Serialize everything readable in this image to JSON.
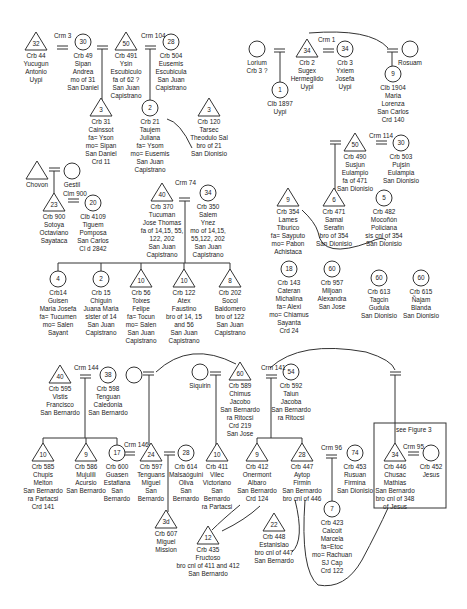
{
  "legend": {
    "see_figure": "see Figure 3"
  },
  "people": [
    {
      "id": "p44",
      "shape": "triangle",
      "x": 36,
      "y": 42,
      "num": "32",
      "label": "Crb 44\nYucugun\nAntonio\nUypi"
    },
    {
      "id": "p49",
      "shape": "circle",
      "x": 83,
      "y": 42,
      "num": "30",
      "label": "Crb 49\nSipan\nAndrea\nmo of 31\nSan Daniel"
    },
    {
      "id": "p491",
      "shape": "triangle",
      "x": 126,
      "y": 42,
      "num": "50",
      "label": "Crb 491\nYsin\nEscubiculo\nfa of 62 ?\nSan Juan\nCapistrano"
    },
    {
      "id": "p504",
      "shape": "circle",
      "x": 171,
      "y": 42,
      "num": "28",
      "label": "Crb 504\nEusemis\nEscubicula\nSan Juan\nCapistrano"
    },
    {
      "id": "p31",
      "shape": "triangle",
      "x": 101,
      "y": 108,
      "num": "3",
      "label": "Crb 31\nCainssot\nfa= Yson\nmo= Sipan\nSan Daniel\nCrd 11"
    },
    {
      "id": "p21",
      "shape": "circle",
      "x": 150,
      "y": 108,
      "num": "2",
      "label": "Crb 21\nTaujem\nJuliana\nfa= Ysom\nmo= Eusemis\nSan Juan\nCapistrano"
    },
    {
      "id": "p120",
      "shape": "triangle",
      "x": 209,
      "y": 108,
      "num": "3",
      "label": "Crb 120\nTarsec\nTheodulo Sal\nbro of 21\nSan Dionisio"
    },
    {
      "id": "lorium",
      "shape": "circle",
      "x": 257,
      "y": 49,
      "num": "",
      "label": "Lorium\nCrb 3 ?"
    },
    {
      "id": "p1897",
      "shape": "circle",
      "x": 280,
      "y": 90,
      "num": "1",
      "label": "Clb 1897\nUypi"
    },
    {
      "id": "p2",
      "shape": "triangle",
      "x": 307,
      "y": 49,
      "num": "34",
      "label": "Crb 2\nSugex\nHermeglido\nUypi"
    },
    {
      "id": "p3",
      "shape": "circle",
      "x": 345,
      "y": 49,
      "num": "34",
      "label": "Crb 3\nYxiem\nJosefa\nUypi"
    },
    {
      "id": "rosuam",
      "shape": "circle",
      "x": 410,
      "y": 49,
      "num": "",
      "label": "Rosuam"
    },
    {
      "id": "p1904",
      "shape": "circle",
      "x": 393,
      "y": 74,
      "num": "9",
      "label": "Clb 1904\nMaria\nLorenza\nSan Carlos\nCrd 140"
    },
    {
      "id": "p490",
      "shape": "triangle",
      "x": 355,
      "y": 143,
      "num": "50",
      "label": "Crb 490\nSusjun\nEulampio\nfa of 471\nSan Dionisio"
    },
    {
      "id": "p503",
      "shape": "circle",
      "x": 401,
      "y": 143,
      "num": "30",
      "label": "Crb 503\nPujsin\nEulampia\nSan Dionisio"
    },
    {
      "id": "chovon",
      "shape": "triangle",
      "x": 37,
      "y": 171,
      "num": "",
      "label": "Chovon"
    },
    {
      "id": "gestil",
      "shape": "circle",
      "x": 72,
      "y": 171,
      "num": "",
      "label": "Gestil"
    },
    {
      "id": "p900",
      "shape": "triangle",
      "x": 54,
      "y": 203,
      "num": "23",
      "label": "Crb 900\nSotoya\nOctaviano\nSayataca"
    },
    {
      "id": "p4109",
      "shape": "circle",
      "x": 93,
      "y": 203,
      "num": "20",
      "label": "Clb 4109\nTiguem\nPomposa\nSan Carlos\nCl d 2842"
    },
    {
      "id": "p370",
      "shape": "triangle",
      "x": 162,
      "y": 193,
      "num": "40",
      "label": "Crb 370\nTucuman\nJose Thomas\nfa of 14,15, 55,\n122, 202\nSan Juan\nCapistrano"
    },
    {
      "id": "p350",
      "shape": "circle",
      "x": 208,
      "y": 193,
      "num": "34",
      "label": "Crb 350\nSalem\nYnez\nmo of 14,15,\n55,122, 202\nSan Juan\nCapistrano"
    },
    {
      "id": "p354",
      "shape": "triangle",
      "x": 288,
      "y": 198,
      "num": "9",
      "label": "Crb 354\nLames\nTiburico\nfa= Sayputo\nmo= Pabon\nAchistaca"
    },
    {
      "id": "p471",
      "shape": "triangle",
      "x": 334,
      "y": 198,
      "num": "6",
      "label": "Crb 471\nSamal\nSerafin\nbro of 354\nSan Dionisio"
    },
    {
      "id": "p482",
      "shape": "circle",
      "x": 384,
      "y": 198,
      "num": "5",
      "label": "Crb 482\nMocoñón\nPoliciana\nsis cnl of 354\nSan Dionisio"
    },
    {
      "id": "p14",
      "shape": "circle",
      "x": 58,
      "y": 279,
      "num": "4",
      "label": "Crb14\nGuisen\nMaria Josefa\nfa= Tucumen\nmo= Salen\nSayant"
    },
    {
      "id": "p15",
      "shape": "circle",
      "x": 101,
      "y": 279,
      "num": "2",
      "label": "Crb 15\nChiguin\nJuana Maria\nsister of 14\nSan Juan\nCapistrano"
    },
    {
      "id": "p56",
      "shape": "triangle",
      "x": 141,
      "y": 279,
      "num": "10",
      "label": "Crb 56\nToixes\nFelipe\nfa= Tocun\nmo= Salen\nSan Juan\nCapistrano"
    },
    {
      "id": "p122",
      "shape": "triangle",
      "x": 184,
      "y": 279,
      "num": "10",
      "label": "Crb 122\nAtex\nFaustino\nbro of 14, 15\nand 56\nSan Juan\nCapistrano"
    },
    {
      "id": "p202",
      "shape": "triangle",
      "x": 230,
      "y": 279,
      "num": "8",
      "label": "Crb 202\nSocol\nBaldomero\nbro of 122\nSan Juan\nCapistrano"
    },
    {
      "id": "p143",
      "shape": "circle",
      "x": 289,
      "y": 269,
      "num": "18",
      "label": "Crb 143\nCateran\nMichalina\nfa= Alexi\nmo= Chiamus\nSayanta\nCrd 24"
    },
    {
      "id": "p957",
      "shape": "circle",
      "x": 332,
      "y": 269,
      "num": "60",
      "label": "Crb 957\nMiljoan\nAlexandra\nSan Jose"
    },
    {
      "id": "p613",
      "shape": "circle",
      "x": 379,
      "y": 278,
      "num": "60",
      "label": "Crb 613\nTagcin\nGudula\nSan Dionisio"
    },
    {
      "id": "p615",
      "shape": "circle",
      "x": 421,
      "y": 278,
      "num": "60",
      "label": "Crb 615\nÑajam\nBlanda\nSan Dionisio"
    },
    {
      "id": "p595",
      "shape": "triangle",
      "x": 60,
      "y": 375,
      "num": "40",
      "label": "Crb 595\nVistis\nFrancisco\nSan Bernardo"
    },
    {
      "id": "p598",
      "shape": "circle",
      "x": 108,
      "y": 375,
      "num": "38",
      "label": "Crb 598\nTenguan\nCaledonia\nSan Bernardo"
    },
    {
      "id": "anon1",
      "shape": "circle",
      "x": 134,
      "y": 375,
      "num": "",
      "label": ""
    },
    {
      "id": "siquirin",
      "shape": "circle",
      "x": 200,
      "y": 372,
      "num": "",
      "label": "Siquirin"
    },
    {
      "id": "p589",
      "shape": "triangle",
      "x": 240,
      "y": 372,
      "num": "60",
      "label": "Crb 589\nChimus\nJacobo\nSan Bernardo\nra Ritocsi\nCrd 219\nSan Jose"
    },
    {
      "id": "p592",
      "shape": "circle",
      "x": 291,
      "y": 372,
      "num": "54",
      "label": "Crb 592\nTaiun\nJacoba\nSan Bernardo\nra Ritocsi"
    },
    {
      "id": "p585",
      "shape": "triangle",
      "x": 43,
      "y": 453,
      "num": "10",
      "label": "Crb 585\nChupis\nMelton\nSan Bernardo\nra Partacsi\nCrd 141"
    },
    {
      "id": "p586",
      "shape": "triangle",
      "x": 86,
      "y": 453,
      "num": "9",
      "label": "Crb 586\nMujulili\nAcursio\nSan Bernardo"
    },
    {
      "id": "p600",
      "shape": "circle",
      "x": 117,
      "y": 453,
      "num": "17",
      "label": "Crb 600\nGuasen\nEstafiana\nSan\nBernardo"
    },
    {
      "id": "p597",
      "shape": "triangle",
      "x": 151,
      "y": 453,
      "num": "24",
      "label": "Crb 597\nTenguans\nMiguel\nSan\nBernardo"
    },
    {
      "id": "p614",
      "shape": "circle",
      "x": 186,
      "y": 453,
      "num": "28",
      "label": "Crb 614\nMalsaóguini\nOliva\nSan\nBernardo"
    },
    {
      "id": "p411",
      "shape": "triangle",
      "x": 217,
      "y": 453,
      "num": "10",
      "label": "Crb 411\nVilec\nVictoriano\nSan\nBernardo\nra Partacsi"
    },
    {
      "id": "p412",
      "shape": "triangle",
      "x": 257,
      "y": 453,
      "num": "9",
      "label": "Crb 412\nOnermont\nAlbaro\nSan Bernardo\nCrd 124"
    },
    {
      "id": "p447",
      "shape": "triangle",
      "x": 302,
      "y": 453,
      "num": "28",
      "label": "Crb 447\nAytop\nFirmin\nSan Bernardo\nbro cnl of 446"
    },
    {
      "id": "p453",
      "shape": "circle",
      "x": 355,
      "y": 453,
      "num": "74",
      "label": "Crb 453\nRusuan\nFirmina\nSan Dionisio"
    },
    {
      "id": "p446",
      "shape": "triangle",
      "x": 395,
      "y": 453,
      "num": "34",
      "label": "Crb 446\nChusac\nMathias\nSan Bernardo\nbro cnl of 348\nof Jesus"
    },
    {
      "id": "p452",
      "shape": "circle",
      "x": 431,
      "y": 453,
      "num": "",
      "label": "Crb 452\nJesus"
    },
    {
      "id": "p607",
      "shape": "triangle",
      "x": 166,
      "y": 520,
      "num": "3d",
      "label": "Crb 607\nMiguel\nMission"
    },
    {
      "id": "p423",
      "shape": "circle",
      "x": 332,
      "y": 509,
      "num": "7",
      "label": "Crb 423\nCalcoit\nMarcela\nfa=Etoc\nmo= Rachuan\nSJ Cap\nCrd 122"
    },
    {
      "id": "p448",
      "shape": "triangle",
      "x": 274,
      "y": 523,
      "num": "22",
      "label": "Crb 448\nEstanislao\nbro cnl of 447\nSan Bernardo"
    },
    {
      "id": "p435",
      "shape": "triangle",
      "x": 208,
      "y": 536,
      "num": "12",
      "label": "Crb 435\nFructoso\nbro cnl of 411 and 412\nSan Bernardo"
    }
  ],
  "marriages": [
    {
      "label": "Crm 3",
      "x": 64,
      "y": 46
    },
    {
      "label": "Crm 104",
      "x": 151,
      "y": 46
    },
    {
      "label": "Crm 1",
      "x": 328,
      "y": 50
    },
    {
      "label": "Crm 114",
      "x": 379,
      "y": 146
    },
    {
      "label": "Clm 900",
      "x": 73,
      "y": 204
    },
    {
      "label": "Crm 74",
      "x": 185,
      "y": 193
    },
    {
      "label": "Crm 144",
      "x": 84,
      "y": 378
    },
    {
      "label": "Crm 141",
      "x": 271,
      "y": 378
    },
    {
      "label": "Crm 146",
      "x": 134,
      "y": 455
    },
    {
      "label": "Crm 96",
      "x": 331,
      "y": 458
    },
    {
      "label": "Crm 95",
      "x": 413,
      "y": 457
    }
  ]
}
